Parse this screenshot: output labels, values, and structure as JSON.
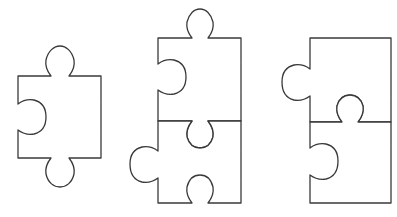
{
  "figure": {
    "stroke_color": "#3a3a3a",
    "fill_color": "#ffffff",
    "background": "#ffffff",
    "groups": [
      {
        "name": "single-piece",
        "pieces": [
          {
            "name": "piece-a",
            "top": "tab",
            "right": "flat",
            "bottom": "tab",
            "left": "blank"
          }
        ]
      },
      {
        "name": "pair-1",
        "pieces": [
          {
            "name": "piece-b-top",
            "top": "tab",
            "right": "flat",
            "bottom": "blank",
            "left": "blank"
          },
          {
            "name": "piece-b-bottom",
            "top": "tab",
            "right": "flat",
            "bottom": "blank",
            "left": "tab"
          }
        ]
      },
      {
        "name": "pair-2",
        "pieces": [
          {
            "name": "piece-c-top",
            "top": "flat",
            "right": "flat",
            "bottom": "blank",
            "left": "tab"
          },
          {
            "name": "piece-c-bottom",
            "top": "tab",
            "right": "flat",
            "bottom": "flat",
            "left": "blank"
          }
        ]
      }
    ]
  }
}
